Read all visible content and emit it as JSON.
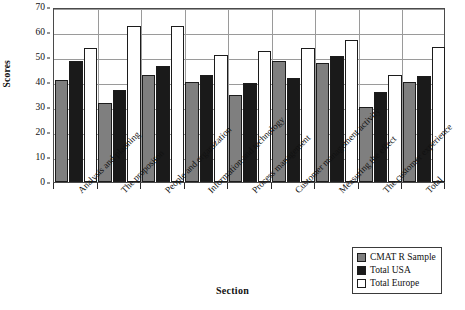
{
  "chart_data": {
    "type": "bar",
    "title": "",
    "xlabel": "Section",
    "ylabel": "Scores",
    "ylim": [
      0,
      70
    ],
    "ytick_step": 10,
    "yticks": [
      0,
      10,
      20,
      30,
      40,
      50,
      60,
      70
    ],
    "grid": true,
    "legend_position": "bottom-right",
    "categories": [
      "Analysis and planning",
      "The propositon",
      "People and organization",
      "Information and technology",
      "Process management",
      "Customer management activity",
      "Measuring the effect",
      "The customer experience",
      "Total"
    ],
    "series": [
      {
        "name": "CMAT R Sample",
        "color": "#7f7f7f",
        "values": [
          41,
          31.5,
          43,
          40,
          35,
          48.5,
          47.5,
          30,
          40
        ]
      },
      {
        "name": "Total USA",
        "color": "#1a1a1a",
        "values": [
          48.5,
          37,
          46.5,
          43,
          39.5,
          41.5,
          50.5,
          36,
          42.5
        ]
      },
      {
        "name": "Total Europe",
        "color": "#ffffff",
        "values": [
          53.5,
          62.5,
          62.5,
          51,
          52.5,
          53.5,
          57,
          43,
          54
        ]
      }
    ]
  },
  "axis": {
    "y_title": "Scores",
    "x_title": "Section",
    "y_tick_labels": [
      "0",
      "10",
      "20",
      "30",
      "40",
      "50",
      "60",
      "70"
    ]
  },
  "legend": {
    "items": [
      {
        "label": "CMAT R Sample",
        "swatch": "s0"
      },
      {
        "label": "Total USA",
        "swatch": "s1"
      },
      {
        "label": "Total Europe",
        "swatch": "s2"
      }
    ]
  }
}
